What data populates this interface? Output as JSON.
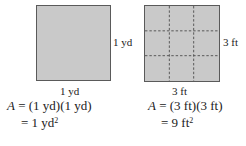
{
  "left_figure": {
    "shape": "square",
    "fill_color": "#c9c9c9",
    "side_label_right": "1 yd",
    "side_label_bottom": "1 yd",
    "equation_line1": {
      "var": "A",
      "rhs": "= (1 yd)(1 yd)"
    },
    "equation_line2": {
      "rhs": "= 1 yd",
      "exponent": "2"
    }
  },
  "right_figure": {
    "shape": "square",
    "fill_color": "#c9c9c9",
    "grid": {
      "rows": 3,
      "cols": 3,
      "line_style": "dashed"
    },
    "side_label_right": "3 ft",
    "side_label_bottom": "3 ft",
    "equation_line1": {
      "var": "A",
      "rhs": "= (3 ft)(3 ft)"
    },
    "equation_line2": {
      "rhs": "= 9 ft",
      "exponent": "2"
    }
  }
}
